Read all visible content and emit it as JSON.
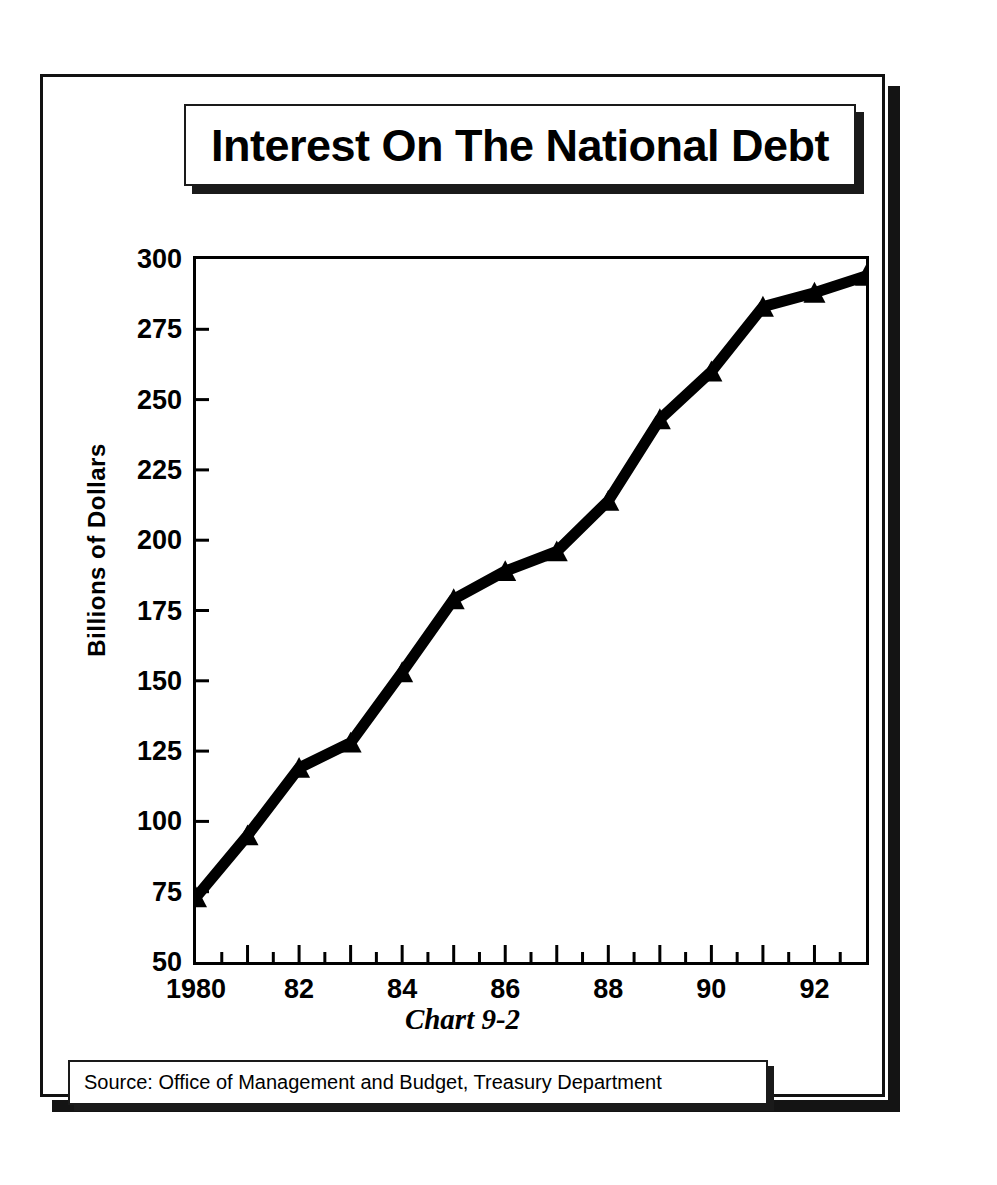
{
  "slide": {
    "title": "Interest On The National Debt",
    "caption": "Chart 9-2",
    "source": "Source:  Office of Management and Budget, Treasury Department",
    "frame_color": "#111111",
    "shadow_color": "#141414"
  },
  "chart_data": {
    "type": "line",
    "title": "Interest On The National Debt",
    "xlabel": "",
    "ylabel": "Billions of Dollars",
    "x": [
      1980,
      1981,
      1982,
      1983,
      1984,
      1985,
      1986,
      1987,
      1988,
      1989,
      1990,
      1991,
      1992,
      1993
    ],
    "categories": [
      "1980",
      "1981",
      "1982",
      "1983",
      "1984",
      "1985",
      "1986",
      "1987",
      "1988",
      "1989",
      "1990",
      "1991",
      "1992",
      "1993"
    ],
    "values": [
      73,
      95,
      119,
      128,
      153,
      179,
      189,
      196,
      214,
      243,
      260,
      283,
      288,
      294
    ],
    "series": [
      {
        "name": "Interest On The National Debt",
        "values": [
          73,
          95,
          119,
          128,
          153,
          179,
          189,
          196,
          214,
          243,
          260,
          283,
          288,
          294
        ]
      }
    ],
    "xlim": [
      1980,
      1993
    ],
    "ylim": [
      50,
      300
    ],
    "ytick_labels": [
      "300",
      "275",
      "250",
      "225",
      "200",
      "175",
      "150",
      "125",
      "100",
      "75",
      "50"
    ],
    "ytick_values": [
      300,
      275,
      250,
      225,
      200,
      175,
      150,
      125,
      100,
      75,
      50
    ],
    "xtick_labels": [
      "1980",
      "82",
      "84",
      "86",
      "88",
      "90",
      "92"
    ],
    "xtick_values": [
      1980,
      1982,
      1984,
      1986,
      1988,
      1990,
      1992
    ],
    "minor_xticks": true,
    "grid": false,
    "legend": false,
    "marker": "triangle",
    "line_color": "#000000",
    "line_width": 11,
    "caption": "Chart 9-2",
    "source": "Source:  Office of Management and Budget, Treasury Department"
  }
}
